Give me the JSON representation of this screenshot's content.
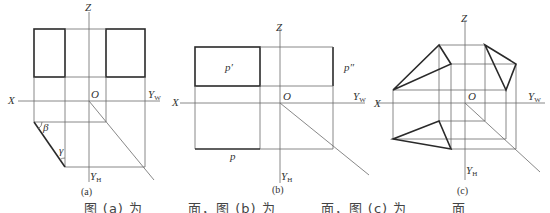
{
  "panels": [
    {
      "id": "a",
      "caption": "(a)",
      "axes": {
        "z": "Z",
        "x": "X",
        "o": "O",
        "yw": "Y",
        "yw_sub": "W",
        "yh": "Y",
        "yh_sub": "H"
      },
      "angles": {
        "beta": "β",
        "gamma": "γ"
      }
    },
    {
      "id": "b",
      "caption": "(b)",
      "axes": {
        "z": "Z",
        "x": "X",
        "o": "O",
        "yw": "Y",
        "yw_sub": "W",
        "yh": "Y",
        "yh_sub": "H"
      },
      "labels": {
        "front": "p′",
        "side": "p″",
        "top": "p"
      }
    },
    {
      "id": "c",
      "caption": "(c)",
      "axes": {
        "z": "Z",
        "x": "X",
        "o": "O",
        "yw": "Y",
        "yw_sub": "W",
        "yh": "Y",
        "yh_sub": "H"
      }
    }
  ],
  "question": "图 (a) 为______面，图 (b) 为______面，图 (c) 为______面"
}
